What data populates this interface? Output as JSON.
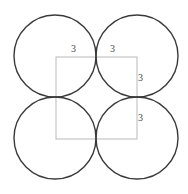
{
  "figure": {
    "background_color": "#ffffff",
    "canvas": {
      "width": 188,
      "height": 194
    },
    "circle_stroke_color": "#3a3a3a",
    "circle_stroke_width": 1.4,
    "square_stroke_color": "#b9b9b9",
    "square_stroke_width": 1,
    "label_color": "#4a4a4a",
    "circles": [
      {
        "name": "top-left-circle",
        "cx": 55,
        "cy": 56,
        "r": 41
      },
      {
        "name": "top-right-circle",
        "cx": 137,
        "cy": 56,
        "r": 41
      },
      {
        "name": "bottom-left-circle",
        "cx": 55,
        "cy": 138,
        "r": 41
      },
      {
        "name": "bottom-right-circle",
        "cx": 137,
        "cy": 138,
        "r": 41
      }
    ],
    "square": {
      "name": "inscribed-square",
      "x": 56,
      "y": 57,
      "width": 81,
      "height": 82
    },
    "labels": [
      {
        "name": "dimension-label-top-left",
        "text": "3",
        "x": 71,
        "y": 44
      },
      {
        "name": "dimension-label-top-right",
        "text": "3",
        "x": 110,
        "y": 44
      },
      {
        "name": "dimension-label-right-upper",
        "text": "3",
        "x": 138,
        "y": 73
      },
      {
        "name": "dimension-label-right-lower",
        "text": "3",
        "x": 138,
        "y": 113
      }
    ]
  },
  "chart_data": {
    "type": "diagram",
    "subtype": "geometry",
    "shapes": [
      {
        "shape": "circle",
        "id": "top-left",
        "center": [
          55,
          56
        ],
        "radius": 41
      },
      {
        "shape": "circle",
        "id": "top-right",
        "center": [
          137,
          56
        ],
        "radius": 41
      },
      {
        "shape": "circle",
        "id": "bottom-left",
        "center": [
          55,
          138
        ],
        "radius": 41
      },
      {
        "shape": "circle",
        "id": "bottom-right",
        "center": [
          137,
          138
        ],
        "radius": 41
      },
      {
        "shape": "square",
        "id": "center-square",
        "top_left": [
          56,
          57
        ],
        "side": 82,
        "vertices": [
          [
            56,
            57
          ],
          [
            137,
            57
          ],
          [
            137,
            139
          ],
          [
            56,
            139
          ]
        ]
      }
    ],
    "annotations": [
      {
        "text": "3",
        "position": [
          71,
          44
        ],
        "refers_to": "top edge, left half"
      },
      {
        "text": "3",
        "position": [
          110,
          44
        ],
        "refers_to": "top edge, right half"
      },
      {
        "text": "3",
        "position": [
          138,
          73
        ],
        "refers_to": "right edge, upper half"
      },
      {
        "text": "3",
        "position": [
          138,
          113
        ],
        "refers_to": "right edge, lower half"
      }
    ],
    "values": [
      3,
      3,
      3,
      3
    ],
    "labels": [
      "3",
      "3",
      "3",
      "3"
    ],
    "grid": false,
    "legend": false
  }
}
